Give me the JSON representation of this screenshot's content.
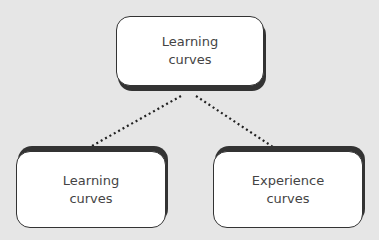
{
  "diagram": {
    "root": {
      "label_line1": "Learning",
      "label_line2": "curves"
    },
    "children": [
      {
        "label_line1": "Learning",
        "label_line2": "curves"
      },
      {
        "label_line1": "Experience",
        "label_line2": "curves"
      }
    ],
    "connector_style": "dotted"
  }
}
